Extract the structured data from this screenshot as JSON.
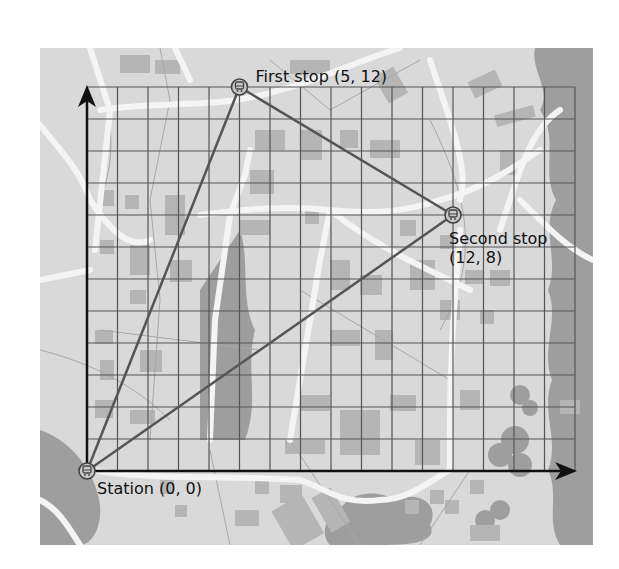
{
  "diagram": {
    "type": "coordinate-grid-map",
    "grid": {
      "columns": 16,
      "rows": 12
    },
    "axes": {
      "x_arrow": true,
      "y_arrow": true
    },
    "points": [
      {
        "id": "station",
        "label": "Station (0, 0)",
        "x": 0,
        "y": 0,
        "icon": "train-icon",
        "label_lines": [
          "Station (0, 0)"
        ]
      },
      {
        "id": "first-stop",
        "label": "First stop (5, 12)",
        "x": 5,
        "y": 12,
        "icon": "train-icon",
        "label_lines": [
          "First stop (5, 12)"
        ]
      },
      {
        "id": "second-stop",
        "label": "Second stop (12, 8)",
        "x": 12,
        "y": 8,
        "icon": "train-icon",
        "label_lines": [
          "Second stop",
          "(12, 8)"
        ]
      }
    ],
    "routes": [
      {
        "from": "station",
        "to": "first-stop"
      },
      {
        "from": "first-stop",
        "to": "second-stop"
      },
      {
        "from": "second-stop",
        "to": "station"
      }
    ],
    "colors": {
      "map_ground": "#d9d9d9",
      "map_block": "#b3b3b3",
      "map_tree": "#9c9c9c",
      "map_road": "#f4f4f4",
      "grid_line": "#555555",
      "axis": "#111111",
      "route": "#555555",
      "icon_fill": "#c8c8c8",
      "icon_stroke": "#444444"
    }
  }
}
